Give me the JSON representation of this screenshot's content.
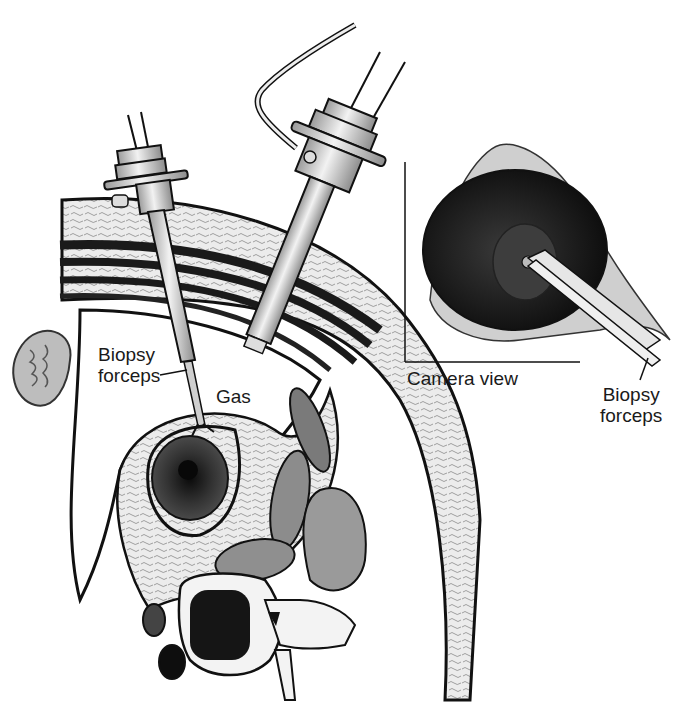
{
  "figure": {
    "type": "medical-illustration",
    "colors": {
      "outline": "#111111",
      "tissue_light": "#e8e8e8",
      "tissue_mid": "#a9a9a9",
      "muscle_dark": "#1c1c1c",
      "organ_dark": "#2a2a2a",
      "instrument": "#d6d6d6",
      "background": "#ffffff"
    }
  },
  "labels": {
    "biopsy_forceps_main_line1": "Biopsy",
    "biopsy_forceps_main_line2": "forceps",
    "gas": "Gas",
    "camera_view": "Camera view",
    "biopsy_forceps_inset_line1": "Biopsy",
    "biopsy_forceps_inset_line2": "forceps"
  },
  "components": {
    "instruments": [
      "biopsy-forceps-trocar",
      "laparoscope-trocar-with-gas-line"
    ],
    "anatomy": [
      "abdominal-wall",
      "muscle-layers",
      "kidney",
      "lesion",
      "vertebra",
      "aorta",
      "vena-cava",
      "psoas-muscles"
    ],
    "inset": "camera-view"
  }
}
